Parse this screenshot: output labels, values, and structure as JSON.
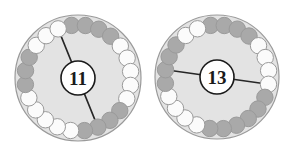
{
  "figure": {
    "background_color": "#ffffff",
    "disc_fill": "#e3e3e3",
    "disc_stroke": "#9a9a9a",
    "bead_gray": "#a9a9a9",
    "bead_white": "#fbfbfb",
    "bead_stroke": "#9a9a9a",
    "chord_color": "#262626",
    "label_ring_fill": "#ffffff",
    "label_ring_stroke": "#1a1a1a",
    "label_text_color": "#1a1a1a"
  },
  "diagrams": [
    {
      "id": "left-diagram",
      "name": "circle-diagram-11",
      "center_label": "11",
      "center": {
        "x": 78,
        "y": 78
      },
      "disc_radius": 63,
      "bead_ring_radius": 53,
      "bead_radius": 8.2,
      "bead_count": 24,
      "label_radius": 17,
      "start_angle_deg": -97,
      "beads": [
        {
          "index": 0,
          "color": "gray"
        },
        {
          "index": 1,
          "color": "gray"
        },
        {
          "index": 2,
          "color": "gray"
        },
        {
          "index": 3,
          "color": "gray"
        },
        {
          "index": 4,
          "color": "white"
        },
        {
          "index": 5,
          "color": "white"
        },
        {
          "index": 6,
          "color": "white"
        },
        {
          "index": 7,
          "color": "white"
        },
        {
          "index": 8,
          "color": "white"
        },
        {
          "index": 9,
          "color": "gray"
        },
        {
          "index": 10,
          "color": "gray"
        },
        {
          "index": 11,
          "color": "gray"
        },
        {
          "index": 12,
          "color": "gray"
        },
        {
          "index": 13,
          "color": "white"
        },
        {
          "index": 14,
          "color": "white"
        },
        {
          "index": 15,
          "color": "white"
        },
        {
          "index": 16,
          "color": "white"
        },
        {
          "index": 17,
          "color": "white"
        },
        {
          "index": 18,
          "color": "gray"
        },
        {
          "index": 19,
          "color": "gray"
        },
        {
          "index": 20,
          "color": "gray"
        },
        {
          "index": 21,
          "color": "white"
        },
        {
          "index": 22,
          "color": "white"
        },
        {
          "index": 23,
          "color": "white"
        }
      ],
      "chord": {
        "from_bead_index": 23,
        "to_bead_index": 11,
        "description": "line from top bead through center label to bottom bead"
      }
    },
    {
      "id": "right-diagram",
      "name": "circle-diagram-13",
      "center_label": "13",
      "center": {
        "x": 217,
        "y": 77
      },
      "disc_radius": 62,
      "bead_ring_radius": 52,
      "bead_radius": 8.2,
      "bead_count": 24,
      "label_radius": 17,
      "start_angle_deg": -97,
      "beads": [
        {
          "index": 0,
          "color": "gray"
        },
        {
          "index": 1,
          "color": "gray"
        },
        {
          "index": 2,
          "color": "gray"
        },
        {
          "index": 3,
          "color": "gray"
        },
        {
          "index": 4,
          "color": "white"
        },
        {
          "index": 5,
          "color": "white"
        },
        {
          "index": 6,
          "color": "white"
        },
        {
          "index": 7,
          "color": "white"
        },
        {
          "index": 8,
          "color": "gray"
        },
        {
          "index": 9,
          "color": "gray"
        },
        {
          "index": 10,
          "color": "gray"
        },
        {
          "index": 11,
          "color": "gray"
        },
        {
          "index": 12,
          "color": "gray"
        },
        {
          "index": 13,
          "color": "gray"
        },
        {
          "index": 14,
          "color": "white"
        },
        {
          "index": 15,
          "color": "white"
        },
        {
          "index": 16,
          "color": "white"
        },
        {
          "index": 17,
          "color": "white"
        },
        {
          "index": 18,
          "color": "gray"
        },
        {
          "index": 19,
          "color": "gray"
        },
        {
          "index": 20,
          "color": "gray"
        },
        {
          "index": 21,
          "color": "gray"
        },
        {
          "index": 22,
          "color": "white"
        },
        {
          "index": 23,
          "color": "white"
        }
      ],
      "chord": {
        "from_bead_index": 19,
        "to_bead_index": 7,
        "description": "line from left bead through center label to right bead"
      }
    }
  ]
}
